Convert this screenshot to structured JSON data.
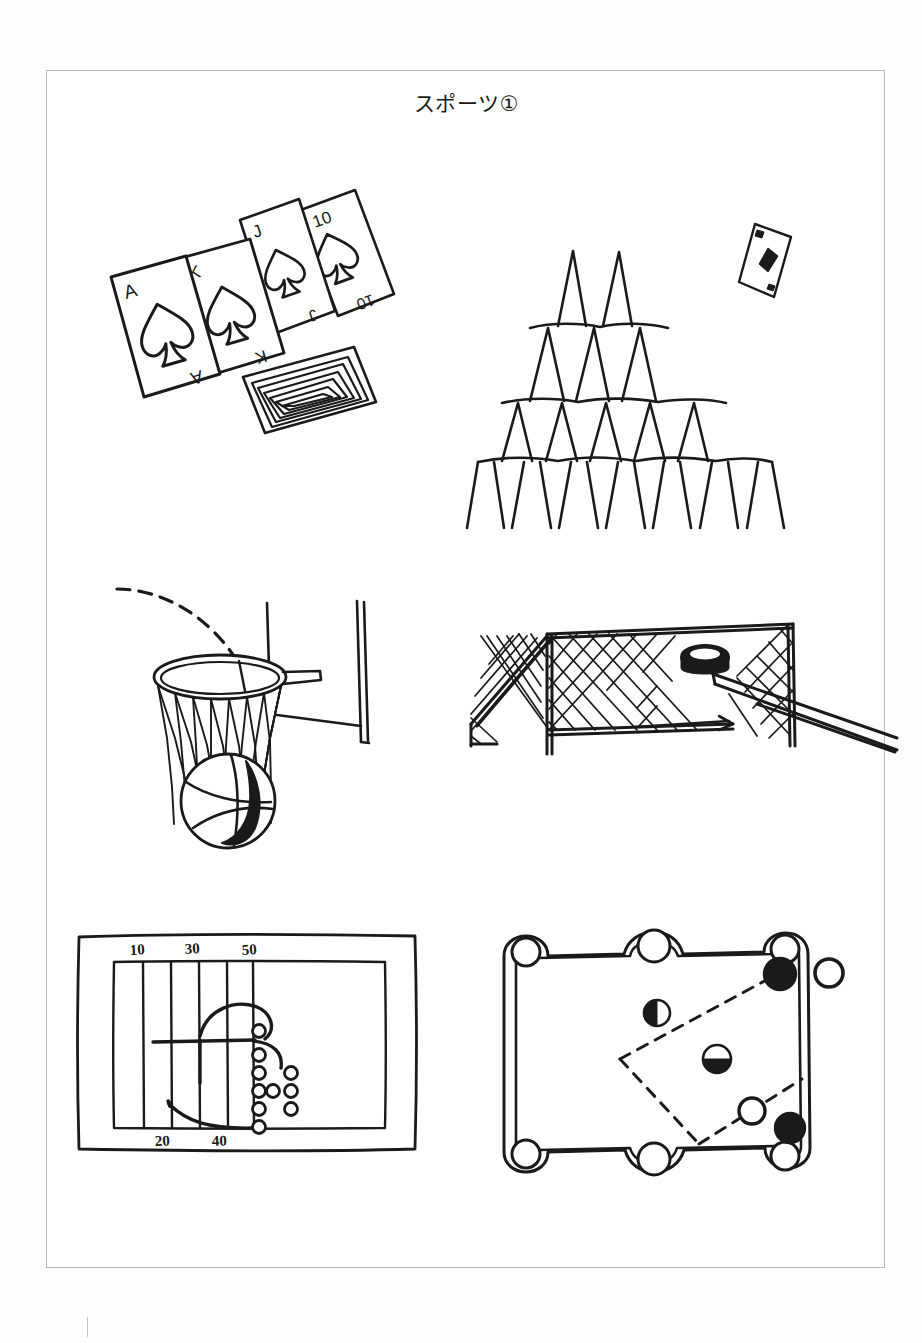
{
  "page": {
    "title": "スポーツ①",
    "background_color": "#ffffff",
    "ink_color": "#1a1a1a",
    "frame_color": "#b9b9b9"
  },
  "panels": [
    {
      "id": "playing-cards",
      "name": "playing-cards-illustration",
      "caption": "Fanned hand of four spade playing cards with a patterned card back lying beside them",
      "card_labels": [
        "A",
        "K",
        "J",
        "10"
      ],
      "suit": "spade",
      "card_back_rings": 6
    },
    {
      "id": "house-of-cards",
      "name": "house-of-cards-illustration",
      "caption": "Pyramid house of cards four tiers high with a diamond card falling at the upper right",
      "tiers": 4,
      "tier_counts": [
        5,
        4,
        3,
        2
      ],
      "falling_card_suit": "diamond"
    },
    {
      "id": "basketball-hoop",
      "name": "basketball-hoop-illustration",
      "caption": "Basketball dropping through a netted hoop on a pole, with a dashed shot trajectory arc",
      "has_trajectory": true,
      "trajectory_style": "dashed"
    },
    {
      "id": "hockey-goal",
      "name": "hockey-goal-illustration",
      "caption": "Ice hockey net with a puck being shot in by a hockey stick entering from the right",
      "equipment": [
        "goal",
        "net",
        "puck",
        "stick"
      ]
    },
    {
      "id": "football-play",
      "name": "football-play-diagram",
      "caption": "American football play diagram on a gridiron with yard line numbers and player positions",
      "yard_markers_top": [
        "10",
        "30",
        "50"
      ],
      "yard_markers_bottom": [
        "20",
        "40"
      ],
      "player_count": 11,
      "route_lines": 2
    },
    {
      "id": "pool-table",
      "name": "pool-table-illustration",
      "caption": "Billiards table seen from above with six pockets, balls and dashed shot lines",
      "pockets": 6,
      "balls": [
        {
          "type": "solid"
        },
        {
          "type": "hollow"
        },
        {
          "type": "half"
        },
        {
          "type": "half"
        },
        {
          "type": "hollow"
        },
        {
          "type": "solid"
        }
      ],
      "shot_lines": 3,
      "shot_line_style": "dashed"
    }
  ]
}
